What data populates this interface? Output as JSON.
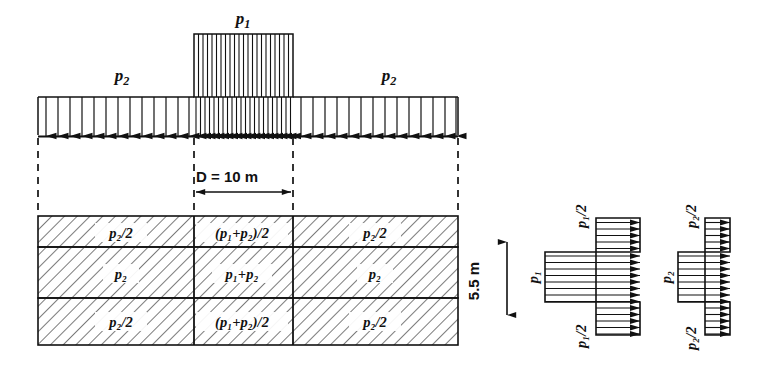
{
  "figure": {
    "type": "engineering-diagram"
  },
  "top_load": {
    "p1_label": "p",
    "p1_sub": "1",
    "p2_left_label": "p",
    "p2_left_sub": "2",
    "p2_right_label": "p",
    "p2_right_sub": "2"
  },
  "dimension_width": {
    "text": "D = 10 m",
    "value": 10,
    "unit": "m",
    "symbol": "D"
  },
  "dimension_depth": {
    "text": "5.5 m",
    "value": 5.5,
    "unit": "m"
  },
  "soil_block": {
    "rows": [
      {
        "left": "p₂/2",
        "center": "(p₁+p₂)/2",
        "right": "p₂/2"
      },
      {
        "left": "p₂",
        "center": "p₁+p₂",
        "right": "p₂"
      },
      {
        "left": "p₂/2",
        "center": "(p₁+p₂)/2",
        "right": "p₂/2"
      }
    ]
  },
  "pressure_diagram_p1": {
    "top_label": "p₁/2",
    "middle_label": "p₁",
    "bottom_label": "p₁/2"
  },
  "pressure_diagram_p2": {
    "top_label": "p₂/2",
    "middle_label": "p₂",
    "bottom_label": "p₂/2"
  },
  "colors": {
    "line": "#1a1a1a",
    "hatch": "#4d4d4d",
    "background": "#ffffff"
  }
}
